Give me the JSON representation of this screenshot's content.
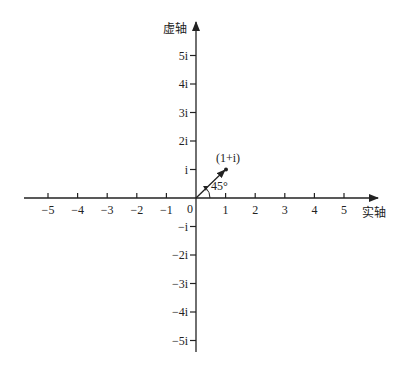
{
  "diagram": {
    "type": "complex-plane",
    "axes": {
      "real_label": "实轴",
      "imag_label": "虚轴",
      "origin_label": "0"
    },
    "real_ticks": [
      {
        "value": -5,
        "label": "−5"
      },
      {
        "value": -4,
        "label": "−4"
      },
      {
        "value": -3,
        "label": "−3"
      },
      {
        "value": -2,
        "label": "−2"
      },
      {
        "value": -1,
        "label": "−1"
      },
      {
        "value": 1,
        "label": "1"
      },
      {
        "value": 2,
        "label": "2"
      },
      {
        "value": 3,
        "label": "3"
      },
      {
        "value": 4,
        "label": "4"
      },
      {
        "value": 5,
        "label": "5"
      }
    ],
    "imag_ticks": [
      {
        "value": 5,
        "label": "5i"
      },
      {
        "value": 4,
        "label": "4i"
      },
      {
        "value": 3,
        "label": "3i"
      },
      {
        "value": 2,
        "label": "2i"
      },
      {
        "value": 1,
        "label": "i"
      },
      {
        "value": -1,
        "label": "−i"
      },
      {
        "value": -2,
        "label": "−2i"
      },
      {
        "value": -3,
        "label": "−3i"
      },
      {
        "value": -4,
        "label": "−4i"
      },
      {
        "value": -5,
        "label": "−5i"
      }
    ],
    "point": {
      "re": 1,
      "im": 1,
      "label": "(1+i)"
    },
    "angle_label": "45°",
    "color": "#222222"
  }
}
